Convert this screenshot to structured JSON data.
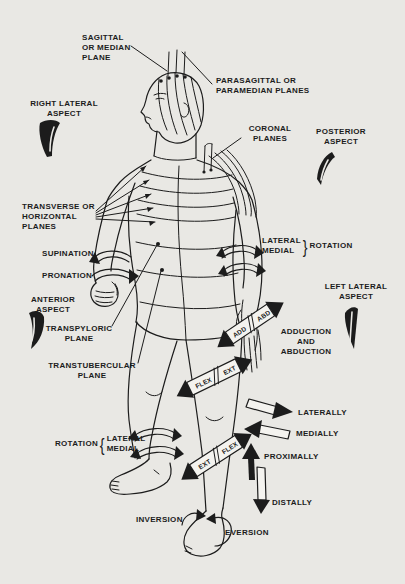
{
  "colors": {
    "background": "#e9e8e4",
    "ink": "#1c1c1c",
    "band_fill": "#f4f3ef"
  },
  "labels": {
    "sagittal": "SAGITTAL\nOR MEDIAN\nPLANE",
    "parasagittal": "PARASAGITTAL OR\nPARAMEDIAN PLANES",
    "right_lateral": "RIGHT LATERAL\nASPECT",
    "coronal": "CORONAL\nPLANES",
    "posterior": "POSTERIOR\nASPECT",
    "transverse": "TRANSVERSE OR\nHORIZONTAL\nPLANES",
    "supination": "SUPINATION",
    "pronation": "PRONATION",
    "left_lateral": "LEFT LATERAL\nASPECT",
    "anterior": "ANTERIOR\nASPECT",
    "transpyloric": "TRANSPYLORIC\nPLANE",
    "transtubercular": "TRANSTUBERCULAR\nPLANE",
    "adduction_abduction": "ADDUCTION\nAND\nABDUCTION",
    "laterally": "LATERALLY",
    "medially": "MEDIALLY",
    "proximally": "PROXIMALLY",
    "distally": "DISTALLY",
    "inversion": "INVERSION",
    "eversion": "EVERSION"
  },
  "rotation_arm": {
    "lateral": "LATERAL",
    "medial": "MEDIAL",
    "rotation": "ROTATION",
    "brace": "}"
  },
  "rotation_leg": {
    "rotation": "ROTATION",
    "brace": "{",
    "lateral": "LATERAL",
    "medial": "MEDIAL"
  },
  "bands": {
    "wrist": {
      "first": "ADD",
      "second": "ABD"
    },
    "thigh": {
      "first": "FLEX",
      "second": "EXT"
    },
    "shin": {
      "first": "EXT",
      "second": "FLEX"
    }
  }
}
